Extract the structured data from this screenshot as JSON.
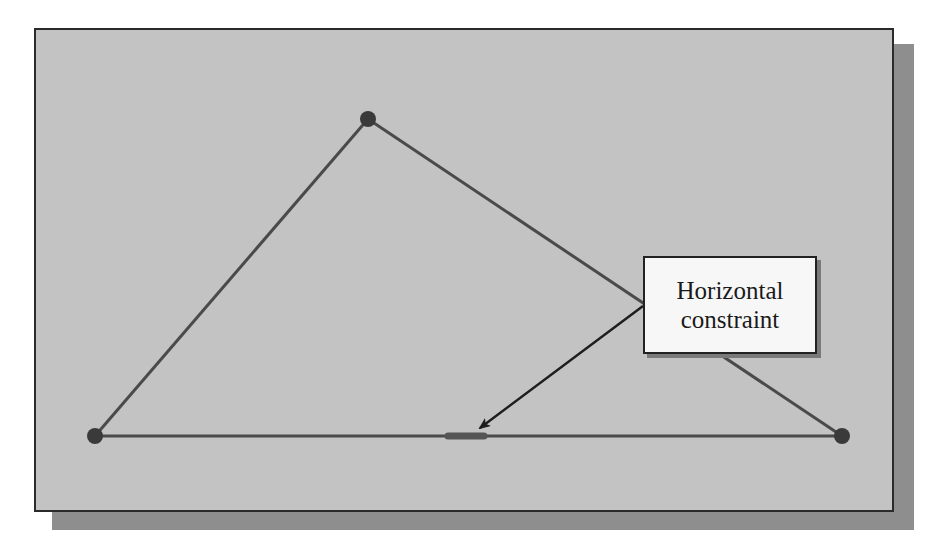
{
  "diagram": {
    "type": "sketch-constraint-illustration",
    "colors": {
      "background": "#ffffff",
      "canvas": "#c3c3c3",
      "shadow": "#8e8e8e",
      "frame_border": "#2a2a2a",
      "line": "#4a4a4a",
      "point": "#3a3a3a",
      "constraint_marker": "#555555",
      "callout_fill": "#f7f7f7",
      "callout_text": "#1a1a1a"
    },
    "points": [
      {
        "id": "apex",
        "x": 368,
        "y": 119
      },
      {
        "id": "left",
        "x": 95,
        "y": 436
      },
      {
        "id": "right",
        "x": 842,
        "y": 436
      }
    ],
    "lines": [
      {
        "from": "left",
        "to": "apex"
      },
      {
        "from": "apex",
        "to": "right"
      },
      {
        "from": "left",
        "to": "right"
      }
    ],
    "constraint_marker": {
      "kind": "horizontal",
      "x1": 448,
      "y1": 436,
      "x2": 484,
      "y2": 436
    },
    "callout": {
      "line1": "Horizontal",
      "line2": "constraint",
      "arrow": {
        "x1": 643,
        "y1": 306,
        "x2": 478,
        "y2": 429
      }
    }
  }
}
